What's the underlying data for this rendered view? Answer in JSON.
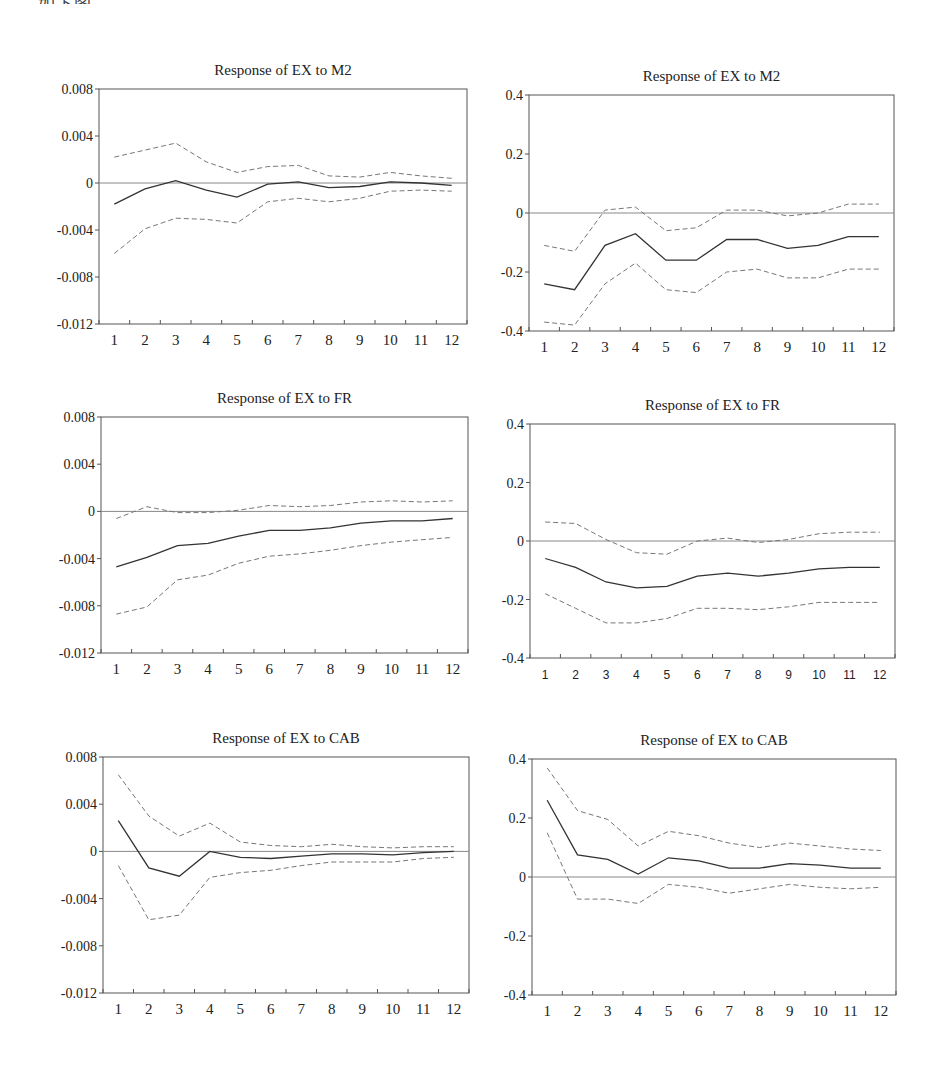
{
  "page": {
    "clipped_header_text": "如下图。"
  },
  "chart_data": [
    {
      "id": "ex_m2_left",
      "type": "line",
      "title": "Response of EX to M2",
      "frame": {
        "left": 99,
        "top": 89,
        "right": 467,
        "bottom": 324
      },
      "x": [
        1,
        2,
        3,
        4,
        5,
        6,
        7,
        8,
        9,
        10,
        11,
        12
      ],
      "xticks": [
        "1",
        "2",
        "3",
        "4",
        "5",
        "6",
        "7",
        "8",
        "9",
        "10",
        "11",
        "12"
      ],
      "ylim": [
        -0.012,
        0.008
      ],
      "yticks": [
        0.008,
        0.004,
        0,
        -0.004,
        -0.008,
        -0.012
      ],
      "ytick_labels": [
        "0.008",
        "0.004",
        "0",
        "-0.004",
        "-0.008",
        "-0.012"
      ],
      "tick_font": "serif",
      "series": [
        {
          "name": "response",
          "style": "solid",
          "values": [
            -0.0018,
            -0.0005,
            0.0002,
            -0.0006,
            -0.0012,
            -0.0001,
            0.0001,
            -0.0004,
            -0.0003,
            0.0001,
            0.0,
            -0.0002
          ]
        },
        {
          "name": "upper_band",
          "style": "dashed",
          "values": [
            0.0022,
            0.0028,
            0.0034,
            0.0018,
            0.0009,
            0.0014,
            0.0015,
            0.0006,
            0.0005,
            0.0009,
            0.0006,
            0.0004
          ]
        },
        {
          "name": "lower_band",
          "style": "dashed",
          "values": [
            -0.006,
            -0.0039,
            -0.003,
            -0.0031,
            -0.0034,
            -0.0016,
            -0.0013,
            -0.0016,
            -0.0013,
            -0.0007,
            -0.0006,
            -0.0007
          ]
        }
      ],
      "zero_line": true
    },
    {
      "id": "ex_m2_right",
      "type": "line",
      "title": "Response of EX to M2",
      "frame": {
        "left": 529,
        "top": 95,
        "right": 894,
        "bottom": 331
      },
      "x": [
        1,
        2,
        3,
        4,
        5,
        6,
        7,
        8,
        9,
        10,
        11,
        12
      ],
      "xticks": [
        "1",
        "2",
        "3",
        "4",
        "5",
        "6",
        "7",
        "8",
        "9",
        "10",
        "11",
        "12"
      ],
      "ylim": [
        -0.4,
        0.4
      ],
      "yticks": [
        0.4,
        0.2,
        0,
        -0.2,
        -0.4
      ],
      "ytick_labels": [
        "0.4",
        "0.2",
        "0",
        "-0.2",
        "-0.4"
      ],
      "tick_font": "serif",
      "series": [
        {
          "name": "response",
          "style": "solid",
          "values": [
            -0.24,
            -0.26,
            -0.11,
            -0.07,
            -0.16,
            -0.16,
            -0.09,
            -0.09,
            -0.12,
            -0.11,
            -0.08,
            -0.08
          ]
        },
        {
          "name": "upper_band",
          "style": "dashed",
          "values": [
            -0.11,
            -0.13,
            0.01,
            0.02,
            -0.06,
            -0.05,
            0.01,
            0.01,
            -0.01,
            0.0,
            0.03,
            0.03
          ]
        },
        {
          "name": "lower_band",
          "style": "dashed",
          "values": [
            -0.37,
            -0.38,
            -0.24,
            -0.17,
            -0.26,
            -0.27,
            -0.2,
            -0.19,
            -0.22,
            -0.22,
            -0.19,
            -0.19
          ]
        }
      ],
      "zero_line": true
    },
    {
      "id": "ex_fr_left",
      "type": "line",
      "title": "Response of EX to FR",
      "frame": {
        "left": 101,
        "top": 417,
        "right": 468,
        "bottom": 653
      },
      "x": [
        1,
        2,
        3,
        4,
        5,
        6,
        7,
        8,
        9,
        10,
        11,
        12
      ],
      "xticks": [
        "1",
        "2",
        "3",
        "4",
        "5",
        "6",
        "7",
        "8",
        "9",
        "10",
        "11",
        "12"
      ],
      "ylim": [
        -0.012,
        0.008
      ],
      "yticks": [
        0.008,
        0.004,
        0,
        -0.004,
        -0.008,
        -0.012
      ],
      "ytick_labels": [
        "0.008",
        "0.004",
        "0",
        "-0.004",
        "-0.008",
        "-0.012"
      ],
      "tick_font": "serif",
      "series": [
        {
          "name": "response",
          "style": "solid",
          "values": [
            -0.0047,
            -0.0039,
            -0.0029,
            -0.0027,
            -0.0021,
            -0.0016,
            -0.0016,
            -0.0014,
            -0.001,
            -0.0008,
            -0.0008,
            -0.0006
          ]
        },
        {
          "name": "upper_band",
          "style": "dashed",
          "values": [
            -0.0006,
            0.0004,
            -0.0001,
            -0.0001,
            0.0001,
            0.0005,
            0.0004,
            0.0005,
            0.0008,
            0.0009,
            0.0008,
            0.0009
          ]
        },
        {
          "name": "lower_band",
          "style": "dashed",
          "values": [
            -0.0087,
            -0.0081,
            -0.0058,
            -0.0054,
            -0.0044,
            -0.0038,
            -0.0036,
            -0.0033,
            -0.0029,
            -0.0026,
            -0.0024,
            -0.0022
          ]
        }
      ],
      "zero_line": true
    },
    {
      "id": "ex_fr_right",
      "type": "line",
      "title": "Response of EX to FR",
      "frame": {
        "left": 530,
        "top": 424,
        "right": 895,
        "bottom": 658
      },
      "x": [
        1,
        2,
        3,
        4,
        5,
        6,
        7,
        8,
        9,
        10,
        11,
        12
      ],
      "xticks": [
        "1",
        "2",
        "3",
        "4",
        "5",
        "6",
        "7",
        "8",
        "9",
        "10",
        "11",
        "12"
      ],
      "ylim": [
        -0.4,
        0.4
      ],
      "yticks": [
        0.4,
        0.2,
        0,
        -0.2,
        -0.4
      ],
      "ytick_labels": [
        "0.4",
        "0.2",
        "0",
        "-0.2",
        "-0.4"
      ],
      "tick_font": "sans",
      "series": [
        {
          "name": "response",
          "style": "solid",
          "values": [
            -0.06,
            -0.09,
            -0.14,
            -0.16,
            -0.155,
            -0.12,
            -0.11,
            -0.12,
            -0.11,
            -0.095,
            -0.09,
            -0.09
          ]
        },
        {
          "name": "upper_band",
          "style": "dashed",
          "values": [
            0.065,
            0.06,
            0.005,
            -0.04,
            -0.045,
            0.0,
            0.01,
            -0.005,
            0.005,
            0.025,
            0.03,
            0.03
          ]
        },
        {
          "name": "lower_band",
          "style": "dashed",
          "values": [
            -0.18,
            -0.23,
            -0.28,
            -0.28,
            -0.265,
            -0.23,
            -0.23,
            -0.235,
            -0.225,
            -0.21,
            -0.21,
            -0.21
          ]
        }
      ],
      "zero_line": true
    },
    {
      "id": "ex_cab_left",
      "type": "line",
      "title": "Response of EX to CAB",
      "frame": {
        "left": 103,
        "top": 757,
        "right": 469,
        "bottom": 993
      },
      "x": [
        1,
        2,
        3,
        4,
        5,
        6,
        7,
        8,
        9,
        10,
        11,
        12
      ],
      "xticks": [
        "1",
        "2",
        "3",
        "4",
        "5",
        "6",
        "7",
        "8",
        "9",
        "10",
        "11",
        "12"
      ],
      "ylim": [
        -0.012,
        0.008
      ],
      "yticks": [
        0.008,
        0.004,
        0,
        -0.004,
        -0.008,
        -0.012
      ],
      "ytick_labels": [
        "0.008",
        "0.004",
        "0",
        "-0.004",
        "-0.008",
        "-0.012"
      ],
      "tick_font": "serif",
      "series": [
        {
          "name": "response",
          "style": "solid",
          "values": [
            0.0026,
            -0.0014,
            -0.0021,
            0.0,
            -0.0005,
            -0.0006,
            -0.0004,
            -0.0002,
            -0.0002,
            -0.0003,
            -0.0001,
            0.0
          ]
        },
        {
          "name": "upper_band",
          "style": "dashed",
          "values": [
            0.0065,
            0.003,
            0.0013,
            0.0024,
            0.0008,
            0.0005,
            0.0004,
            0.0006,
            0.0004,
            0.0003,
            0.0004,
            0.0004
          ]
        },
        {
          "name": "lower_band",
          "style": "dashed",
          "values": [
            -0.0012,
            -0.0058,
            -0.0054,
            -0.0022,
            -0.0018,
            -0.0016,
            -0.0012,
            -0.0009,
            -0.0009,
            -0.0009,
            -0.0006,
            -0.0005
          ]
        }
      ],
      "zero_line": true
    },
    {
      "id": "ex_cab_right",
      "type": "line",
      "title": "Response of EX to CAB",
      "frame": {
        "left": 532,
        "top": 759,
        "right": 896,
        "bottom": 995
      },
      "x": [
        1,
        2,
        3,
        4,
        5,
        6,
        7,
        8,
        9,
        10,
        11,
        12
      ],
      "xticks": [
        "1",
        "2",
        "3",
        "4",
        "5",
        "6",
        "7",
        "8",
        "9",
        "10",
        "11",
        "12"
      ],
      "ylim": [
        -0.4,
        0.4
      ],
      "yticks": [
        0.4,
        0.2,
        0,
        -0.2,
        -0.4
      ],
      "ytick_labels": [
        "0.4",
        "0.2",
        "0",
        "-0.2",
        "-0.4"
      ],
      "tick_font": "serif",
      "series": [
        {
          "name": "response",
          "style": "solid",
          "values": [
            0.26,
            0.075,
            0.06,
            0.01,
            0.065,
            0.055,
            0.03,
            0.03,
            0.045,
            0.04,
            0.03,
            0.03
          ]
        },
        {
          "name": "upper_band",
          "style": "dashed",
          "values": [
            0.37,
            0.225,
            0.195,
            0.105,
            0.155,
            0.14,
            0.115,
            0.1,
            0.115,
            0.105,
            0.095,
            0.09
          ]
        },
        {
          "name": "lower_band",
          "style": "dashed",
          "values": [
            0.15,
            -0.075,
            -0.075,
            -0.09,
            -0.025,
            -0.035,
            -0.055,
            -0.04,
            -0.025,
            -0.035,
            -0.04,
            -0.035
          ]
        }
      ],
      "zero_line": true
    }
  ]
}
